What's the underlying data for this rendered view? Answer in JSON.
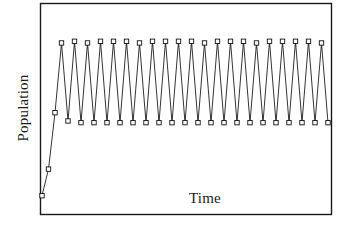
{
  "figure": {
    "title": "",
    "background_color": "#ffffff",
    "frame_color": "#1a1a1a",
    "line_color": "#111111",
    "marker_fill": "#ffffff"
  },
  "axes": {
    "x_label": "Time",
    "y_label": "Population",
    "x_ticks": [],
    "y_ticks": [],
    "grid": false
  },
  "chart_data": {
    "type": "line",
    "title": "",
    "xlabel": "Time",
    "ylabel": "Population",
    "xlim": [
      0,
      24
    ],
    "ylim": [
      0,
      1
    ],
    "grid": false,
    "legend": null,
    "marker": "open-square",
    "series": [
      {
        "name": "Population",
        "x": [
          0,
          1,
          2,
          3,
          4,
          5,
          6,
          7,
          8,
          9,
          10,
          11,
          12,
          13,
          14,
          15,
          16,
          17,
          18,
          19,
          20,
          21,
          22,
          23,
          24,
          25,
          26,
          27,
          28,
          29,
          30,
          31,
          32,
          33,
          34,
          35,
          36,
          37,
          38,
          39,
          40,
          41,
          42,
          43,
          44
        ],
        "y": [
          0.02,
          0.18,
          0.52,
          0.94,
          0.47,
          0.95,
          0.46,
          0.94,
          0.46,
          0.95,
          0.46,
          0.95,
          0.46,
          0.95,
          0.46,
          0.94,
          0.46,
          0.95,
          0.46,
          0.95,
          0.46,
          0.95,
          0.46,
          0.95,
          0.46,
          0.94,
          0.46,
          0.95,
          0.46,
          0.95,
          0.46,
          0.95,
          0.46,
          0.94,
          0.46,
          0.95,
          0.46,
          0.95,
          0.46,
          0.95,
          0.46,
          0.95,
          0.46,
          0.94,
          0.46
        ]
      }
    ]
  }
}
